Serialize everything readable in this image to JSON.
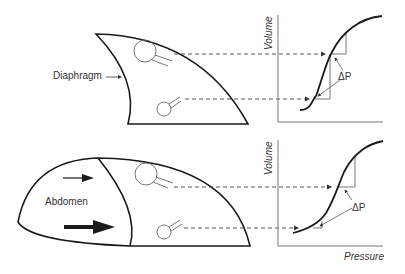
{
  "figure": {
    "top_panel": {
      "lung_label": "Diaphragm",
      "axis_y_label": "Volume",
      "delta_label": "ΔP"
    },
    "bottom_panel": {
      "abdomen_label": "Abdomen",
      "axis_y_label": "Volume",
      "axis_x_label": "Pressure",
      "delta_label": "ΔP"
    }
  },
  "colors": {
    "outline": "#1a1a1a",
    "axis": "#777777",
    "text": "#333333"
  }
}
